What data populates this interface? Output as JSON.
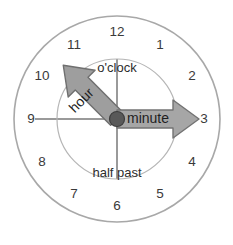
{
  "figure": {
    "center": {
      "x": 117,
      "y": 119
    },
    "outer_circle": {
      "radius": 103,
      "stroke": "#a8a8a8",
      "fill": "#ffffff",
      "stroke_width": 1.6
    },
    "inner_circle": {
      "radius": 60,
      "stroke": "#b5b5b5",
      "fill": "#ffffff",
      "stroke_width": 1.2
    },
    "crosshair": {
      "color": "#9a9a9a",
      "width": 2
    }
  },
  "hour_numbers": [
    {
      "label": "12",
      "angle_deg": 0,
      "x": 117,
      "y": 32
    },
    {
      "label": "1",
      "angle_deg": 30,
      "x": 160,
      "y": 45
    },
    {
      "label": "2",
      "angle_deg": 60,
      "x": 192,
      "y": 76
    },
    {
      "label": "3",
      "angle_deg": 90,
      "x": 204,
      "y": 119
    },
    {
      "label": "4",
      "angle_deg": 120,
      "x": 192,
      "y": 162
    },
    {
      "label": "5",
      "angle_deg": 150,
      "x": 160,
      "y": 194
    },
    {
      "label": "6",
      "angle_deg": 180,
      "x": 117,
      "y": 206
    },
    {
      "label": "7",
      "angle_deg": 210,
      "x": 74,
      "y": 194
    },
    {
      "label": "8",
      "angle_deg": 240,
      "x": 42,
      "y": 162
    },
    {
      "label": "9",
      "angle_deg": 270,
      "x": 31,
      "y": 119
    },
    {
      "label": "10",
      "angle_deg": 300,
      "x": 42,
      "y": 76
    },
    {
      "label": "11",
      "angle_deg": 330,
      "x": 74,
      "y": 45
    }
  ],
  "phrases": {
    "top": {
      "text": "o'clock",
      "x": 117,
      "y": 69
    },
    "bottom": {
      "text": "half past",
      "x": 117,
      "y": 174
    }
  },
  "hands": [
    {
      "name": "hour",
      "label": "hour",
      "points_to": "between 10 and 11",
      "angle_deg": 315,
      "length": 76,
      "fill": "#9e9e9e",
      "stroke": "#6f6f6f",
      "label_x": 82,
      "label_y": 101,
      "label_rotation": -45
    },
    {
      "name": "minute",
      "label": "minute",
      "points_to": "3",
      "angle_deg": 90,
      "length": 82,
      "fill": "#a6a6a6",
      "stroke": "#737373",
      "label_x": 148,
      "label_y": 119,
      "label_rotation": 0
    }
  ],
  "center_hub": {
    "radius": 7.5,
    "fill": "#595959",
    "stroke": "#3d3d3d"
  }
}
